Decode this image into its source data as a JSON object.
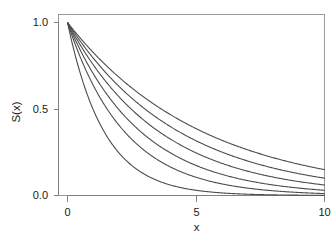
{
  "chart_data": {
    "type": "line",
    "title": "",
    "subtitle": "",
    "xlabel": "x",
    "ylabel": "S(x)",
    "xlim": [
      0,
      10
    ],
    "ylim": [
      0.0,
      1.05
    ],
    "xticks": [
      0,
      5,
      10
    ],
    "xtick_labels": [
      "0",
      "5",
      "10"
    ],
    "yticks": [
      0.0,
      0.5,
      1.0
    ],
    "ytick_labels": [
      "0.0",
      "0.5",
      "1.0"
    ],
    "grid": false,
    "legend": "none",
    "line_color": "#4d4d4d",
    "axis_color": "#808080",
    "background": "#ffffff",
    "x": [
      0,
      0.25,
      0.5,
      0.75,
      1,
      1.25,
      1.5,
      1.75,
      2,
      2.5,
      3,
      3.5,
      4,
      4.5,
      5,
      5.5,
      6,
      6.5,
      7,
      7.5,
      8,
      8.5,
      9,
      9.5,
      10
    ],
    "series": [
      {
        "name": "rate-0.19",
        "rate": 0.19,
        "values": [
          1.0,
          0.954,
          0.909,
          0.867,
          0.827,
          0.789,
          0.752,
          0.717,
          0.684,
          0.622,
          0.566,
          0.515,
          0.468,
          0.425,
          0.387,
          0.352,
          0.32,
          0.291,
          0.264,
          0.24,
          0.219,
          0.199,
          0.181,
          0.164,
          0.15
        ]
      },
      {
        "name": "rate-0.23",
        "rate": 0.23,
        "values": [
          1.0,
          0.944,
          0.891,
          0.841,
          0.795,
          0.75,
          0.708,
          0.669,
          0.631,
          0.563,
          0.502,
          0.447,
          0.398,
          0.355,
          0.317,
          0.282,
          0.251,
          0.224,
          0.2,
          0.178,
          0.159,
          0.141,
          0.126,
          0.112,
          0.1
        ]
      },
      {
        "name": "rate-0.28",
        "rate": 0.28,
        "values": [
          1.0,
          0.932,
          0.869,
          0.811,
          0.756,
          0.705,
          0.657,
          0.612,
          0.571,
          0.497,
          0.432,
          0.375,
          0.326,
          0.284,
          0.247,
          0.214,
          0.186,
          0.162,
          0.141,
          0.123,
          0.107,
          0.093,
          0.081,
          0.07,
          0.061
        ]
      },
      {
        "name": "rate-0.35",
        "rate": 0.35,
        "values": [
          1.0,
          0.916,
          0.839,
          0.769,
          0.705,
          0.646,
          0.592,
          0.542,
          0.497,
          0.417,
          0.35,
          0.293,
          0.247,
          0.207,
          0.174,
          0.146,
          0.122,
          0.103,
          0.086,
          0.072,
          0.061,
          0.051,
          0.043,
          0.036,
          0.03
        ]
      },
      {
        "name": "rate-0.45",
        "rate": 0.45,
        "values": [
          1.0,
          0.894,
          0.799,
          0.714,
          0.638,
          0.57,
          0.509,
          0.455,
          0.407,
          0.325,
          0.259,
          0.207,
          0.165,
          0.132,
          0.105,
          0.084,
          0.067,
          0.054,
          0.043,
          0.034,
          0.027,
          0.022,
          0.017,
          0.014,
          0.011
        ]
      },
      {
        "name": "rate-0.70",
        "rate": 0.7,
        "values": [
          1.0,
          0.839,
          0.705,
          0.592,
          0.497,
          0.417,
          0.35,
          0.294,
          0.247,
          0.174,
          0.122,
          0.086,
          0.061,
          0.043,
          0.03,
          0.021,
          0.015,
          0.01,
          0.007,
          0.005,
          0.004,
          0.003,
          0.002,
          0.001,
          0.001
        ]
      }
    ],
    "endpoint_values_at_x10": [
      0.15,
      0.12,
      0.09,
      0.07,
      0.05,
      0.03
    ],
    "curve_count": 6,
    "start_value": 1.0
  }
}
